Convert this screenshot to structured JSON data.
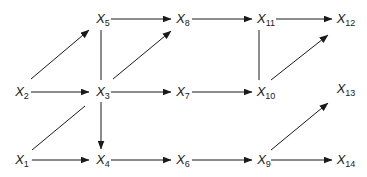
{
  "diagram": {
    "type": "directed-graph",
    "line_color": "#1a1a1a",
    "nodes": [
      {
        "id": "X1",
        "base": "X",
        "sub": "1",
        "x": 22,
        "y": 161
      },
      {
        "id": "X2",
        "base": "X",
        "sub": "2",
        "x": 22,
        "y": 93
      },
      {
        "id": "X3",
        "base": "X",
        "sub": "3",
        "x": 103,
        "y": 93
      },
      {
        "id": "X4",
        "base": "X",
        "sub": "4",
        "x": 103,
        "y": 161
      },
      {
        "id": "X5",
        "base": "X",
        "sub": "5",
        "x": 103,
        "y": 20
      },
      {
        "id": "X6",
        "base": "X",
        "sub": "6",
        "x": 183,
        "y": 161
      },
      {
        "id": "X7",
        "base": "X",
        "sub": "7",
        "x": 183,
        "y": 93
      },
      {
        "id": "X8",
        "base": "X",
        "sub": "8",
        "x": 183,
        "y": 20
      },
      {
        "id": "X9",
        "base": "X",
        "sub": "9",
        "x": 264,
        "y": 161
      },
      {
        "id": "X10",
        "base": "X",
        "sub": "10",
        "x": 266,
        "y": 93
      },
      {
        "id": "X11",
        "base": "X",
        "sub": "11",
        "x": 266,
        "y": 20
      },
      {
        "id": "X12",
        "base": "X",
        "sub": "12",
        "x": 346,
        "y": 20
      },
      {
        "id": "X13",
        "base": "X",
        "sub": "13",
        "x": 346,
        "y": 90
      },
      {
        "id": "X14",
        "base": "X",
        "sub": "14",
        "x": 346,
        "y": 161
      }
    ],
    "edges": [
      {
        "from": "X5",
        "to": "X8",
        "directed": true,
        "x1": 111,
        "y1": 19,
        "x2": 171,
        "y2": 19
      },
      {
        "from": "X8",
        "to": "X11",
        "directed": true,
        "x1": 192,
        "y1": 19,
        "x2": 252,
        "y2": 19
      },
      {
        "from": "X11",
        "to": "X12",
        "directed": true,
        "x1": 276,
        "y1": 19,
        "x2": 332,
        "y2": 19
      },
      {
        "from": "X2",
        "to": "X5",
        "directed": true,
        "x1": 31,
        "y1": 79,
        "x2": 89,
        "y2": 30
      },
      {
        "from": "X3",
        "to": "X5",
        "directed": false,
        "x1": 101,
        "y1": 30,
        "x2": 101,
        "y2": 80
      },
      {
        "from": "X3",
        "to": "X8",
        "directed": true,
        "x1": 113,
        "y1": 79,
        "x2": 171,
        "y2": 31
      },
      {
        "from": "X11",
        "to": "X10",
        "directed": false,
        "x1": 259,
        "y1": 30,
        "x2": 259,
        "y2": 80
      },
      {
        "from": "X10",
        "to": "X12",
        "directed": true,
        "x1": 271,
        "y1": 80,
        "x2": 328,
        "y2": 35
      },
      {
        "from": "X2",
        "to": "X3",
        "directed": true,
        "x1": 31,
        "y1": 92,
        "x2": 89,
        "y2": 92
      },
      {
        "from": "X3",
        "to": "X7",
        "directed": true,
        "x1": 111,
        "y1": 92,
        "x2": 171,
        "y2": 92
      },
      {
        "from": "X7",
        "to": "X10",
        "directed": true,
        "x1": 192,
        "y1": 92,
        "x2": 252,
        "y2": 92
      },
      {
        "from": "X1",
        "to": "X3",
        "directed": false,
        "x1": 32,
        "y1": 150,
        "x2": 85,
        "y2": 106
      },
      {
        "from": "X3",
        "to": "X4",
        "directed": true,
        "x1": 101,
        "y1": 102,
        "x2": 101,
        "y2": 149
      },
      {
        "from": "X1",
        "to": "X4",
        "directed": true,
        "x1": 32,
        "y1": 160,
        "x2": 89,
        "y2": 160
      },
      {
        "from": "X4",
        "to": "X6",
        "directed": true,
        "x1": 111,
        "y1": 160,
        "x2": 171,
        "y2": 160
      },
      {
        "from": "X6",
        "to": "X9",
        "directed": true,
        "x1": 192,
        "y1": 160,
        "x2": 252,
        "y2": 160
      },
      {
        "from": "X9",
        "to": "X13",
        "directed": true,
        "x1": 271,
        "y1": 150,
        "x2": 328,
        "y2": 103
      },
      {
        "from": "X9",
        "to": "X14",
        "directed": true,
        "x1": 271,
        "y1": 160,
        "x2": 332,
        "y2": 160
      }
    ]
  }
}
